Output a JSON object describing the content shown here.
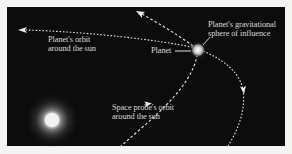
{
  "diagram": {
    "background_color": "#0c0c0c",
    "page_color": "#f4f4f2",
    "line_color": "#e6e6e6",
    "text_color": "#d8d8d8",
    "objects": {
      "sun": {
        "name": "Sun",
        "label": ""
      },
      "planet": {
        "name": "Planet",
        "label": "Planet"
      }
    },
    "labels": {
      "planet_orbit": {
        "line1": "Planet's orbit",
        "line2": "around the sun"
      },
      "planet": {
        "text": "Planet"
      },
      "sphere": {
        "line1": "Planet's gravitational",
        "line2": "sphere of influence"
      },
      "probe_orbit": {
        "line1": "Space probe's orbit",
        "line2": "around the sun"
      }
    },
    "paths": [
      {
        "id": "planet-orbit",
        "description": "Planet's orbit around the sun",
        "style": "dashed",
        "arrows": [
          "left",
          "down"
        ]
      },
      {
        "id": "probe-orbit",
        "description": "Space probe's orbit around the sun",
        "style": "dashed",
        "arrows": [
          "up-right",
          "up-left"
        ]
      }
    ]
  }
}
